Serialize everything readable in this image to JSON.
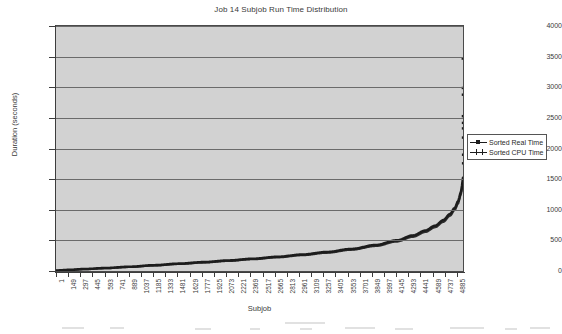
{
  "chart_data": {
    "type": "line",
    "title": "Job 14 Subjob Run Time Distribution",
    "xlabel": "Subjob",
    "ylabel": "Duration (seconds)",
    "ylim": [
      0,
      4000
    ],
    "ytick_step": 500,
    "yticks": [
      0,
      500,
      1000,
      1500,
      2000,
      2500,
      3000,
      3500,
      4000
    ],
    "ytick_labels": [
      "0",
      "500",
      "1000",
      "1500",
      "2000",
      "2500",
      "3000",
      "3500",
      "4000"
    ],
    "xlim": [
      1,
      4959
    ],
    "xticks": [
      1,
      149,
      297,
      445,
      593,
      741,
      889,
      1037,
      1185,
      1333,
      1481,
      1629,
      1777,
      1925,
      2073,
      2221,
      2369,
      2517,
      2665,
      2813,
      2961,
      3109,
      3257,
      3405,
      3553,
      3701,
      3849,
      3997,
      4145,
      4293,
      4441,
      4589,
      4737,
      4885
    ],
    "xtick_labels": [
      "1",
      "149",
      "297",
      "445",
      "593",
      "741",
      "889",
      "1037",
      "1185",
      "1333",
      "1481",
      "1629",
      "1777",
      "1925",
      "2073",
      "2221",
      "2369",
      "2517",
      "2665",
      "2813",
      "2961",
      "3109",
      "3257",
      "3405",
      "3553",
      "3701",
      "3849",
      "3997",
      "4145",
      "4293",
      "4441",
      "4589",
      "4737",
      "4885"
    ],
    "grid": true,
    "grid_axis": "y",
    "legend_position": "right",
    "plot_background": "#d2d2d2",
    "series": [
      {
        "name": "Sorted Real Time",
        "color": "#1d1d1d",
        "x": [
          1,
          150,
          350,
          600,
          900,
          1200,
          1500,
          1800,
          2100,
          2400,
          2700,
          3000,
          3300,
          3600,
          3900,
          4150,
          4350,
          4500,
          4620,
          4720,
          4800,
          4860,
          4900,
          4930,
          4950,
          4959
        ],
        "values": [
          8,
          18,
          32,
          48,
          70,
          95,
          120,
          145,
          172,
          200,
          232,
          268,
          310,
          360,
          425,
          500,
          580,
          660,
          740,
          830,
          930,
          1030,
          1140,
          1270,
          1400,
          1520
        ]
      },
      {
        "name": "Sorted CPU Time",
        "color": "#1d1d1d",
        "x": [
          1,
          150,
          350,
          600,
          900,
          1200,
          1500,
          1800,
          2100,
          2400,
          2700,
          3000,
          3300,
          3600,
          3900,
          4150,
          4350,
          4500,
          4620,
          4720,
          4800,
          4860,
          4900,
          4930,
          4950,
          4959
        ],
        "values": [
          6,
          15,
          28,
          43,
          63,
          87,
          112,
          136,
          162,
          190,
          220,
          255,
          295,
          344,
          406,
          478,
          556,
          634,
          712,
          800,
          898,
          995,
          1100,
          1225,
          1350,
          1465
        ]
      }
    ],
    "outliers": {
      "note": "vertical scatter of points at far right edge",
      "x": [
        4955,
        4956,
        4957,
        4957,
        4958,
        4958,
        4958,
        4959,
        4959
      ],
      "values": [
        3470,
        2990,
        2880,
        2530,
        2420,
        2330,
        2180,
        1900,
        1760
      ]
    }
  },
  "legend": {
    "items": [
      {
        "label": "Sorted Real Time",
        "marker": "line-square"
      },
      {
        "label": "Sorted CPU Time",
        "marker": "line-cross"
      }
    ]
  }
}
